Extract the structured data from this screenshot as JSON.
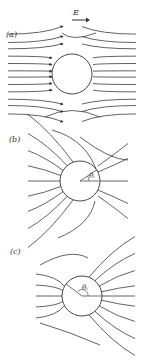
{
  "figure": {
    "field_label": "E",
    "panels": [
      {
        "id": "a",
        "label": "(a)",
        "angle_label": ""
      },
      {
        "id": "b",
        "label": "(b)",
        "angle_label": "θᵢ"
      },
      {
        "id": "c",
        "label": "(c)",
        "angle_label": "θᵢ"
      }
    ]
  }
}
